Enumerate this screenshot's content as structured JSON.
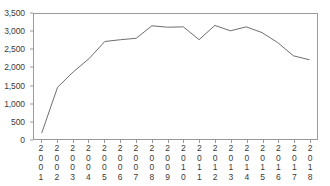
{
  "chart_data": {
    "type": "line",
    "title": "",
    "subtitle": "",
    "xlabel": "",
    "ylabel": "",
    "categories": [
      "2001",
      "2002",
      "2003",
      "2004",
      "2005",
      "2006",
      "2007",
      "2008",
      "2009",
      "2010",
      "2011",
      "2012",
      "2013",
      "2014",
      "2015",
      "2016",
      "2017",
      "2018"
    ],
    "values": [
      180,
      1450,
      1880,
      2250,
      2730,
      2780,
      2820,
      3170,
      3130,
      3140,
      2780,
      3180,
      3030,
      3140,
      2980,
      2700,
      2330,
      2220
    ],
    "series": [
      {
        "name": "series-1",
        "values": [
          180,
          1450,
          1880,
          2250,
          2730,
          2780,
          2820,
          3170,
          3130,
          3140,
          2780,
          3180,
          3030,
          3140,
          2980,
          2700,
          2330,
          2220
        ]
      }
    ],
    "ylim": [
      0,
      3500
    ],
    "yticks": [
      0,
      500,
      1000,
      1500,
      2000,
      2500,
      3000,
      3500
    ],
    "ytick_labels": [
      "0",
      "500",
      "1,000",
      "1,500",
      "2,000",
      "2,500",
      "3,000",
      "3,500"
    ],
    "grid": false,
    "legend": false,
    "legend_position": "none",
    "line_color": "#6e6e6e",
    "frame_color": "#9a9a9a",
    "background_color": "#ffffff",
    "text_color": "#3a3a3a"
  }
}
